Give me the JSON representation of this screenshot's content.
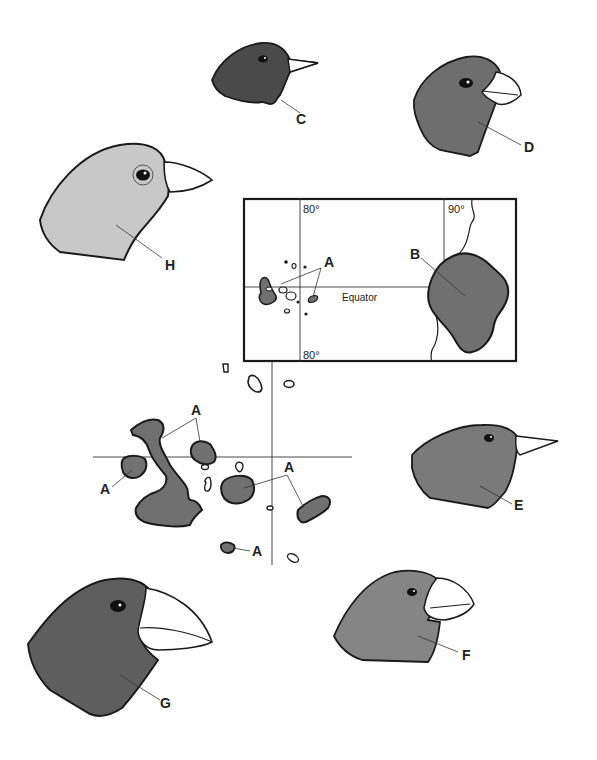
{
  "figure": {
    "inset_map": {
      "longitude_labels": [
        "80°",
        "90°",
        "80°"
      ],
      "equator_label": "Equator",
      "islands_label": "A",
      "mainland_label": "B"
    },
    "main_map": {
      "island_labels": [
        "A",
        "A",
        "A",
        "A"
      ]
    },
    "finch_heads": [
      {
        "label": "C",
        "beak": "small pointed",
        "shade": "#4a4a4a"
      },
      {
        "label": "D",
        "beak": "medium curved",
        "shade": "#6e6e6e"
      },
      {
        "label": "E",
        "beak": "long pointed",
        "shade": "#7a7a7a"
      },
      {
        "label": "F",
        "beak": "large crushing",
        "shade": "#858585"
      },
      {
        "label": "G",
        "beak": "very large crushing",
        "shade": "#5e5e5e"
      },
      {
        "label": "H",
        "beak": "medium pointed",
        "shade": "#c8c8c8"
      }
    ],
    "colors": {
      "ink": "#1a1a1a",
      "land_fill": "#707070",
      "paper": "#ffffff"
    }
  }
}
